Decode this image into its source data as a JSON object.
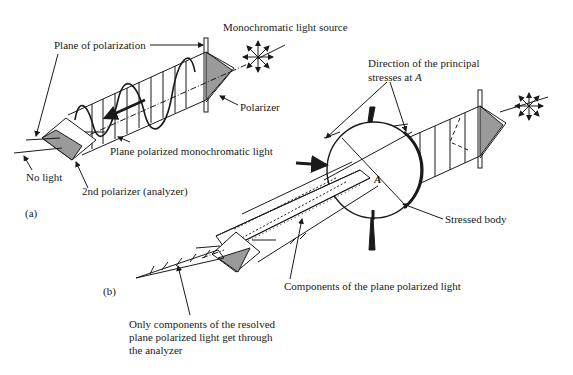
{
  "diagram": {
    "colors": {
      "ink": "#1a1a1a",
      "polarizer_fill": "#9a9a9a",
      "background": "#ffffff"
    },
    "part_a": {
      "label": "(a)",
      "labels": {
        "light_source": "Monochromatic light source",
        "plane_of_polarization": "Plane of polarization",
        "polarizer": "Polarizer",
        "plane_polarized_light": "Plane polarized monochromatic light",
        "no_light": "No light",
        "analyzer": "2nd polarizer (analyzer)"
      }
    },
    "part_b": {
      "label": "(b)",
      "labels": {
        "principal_stresses_line1": "Direction of the principal",
        "principal_stresses_line2": "stresses at",
        "point": "A",
        "stressed_body": "Stressed body",
        "components": "Components of the plane polarized light",
        "resolved_line1": "Only components of the resolved",
        "resolved_line2": "plane polarized light get through",
        "resolved_line3": "the analyzer"
      }
    }
  }
}
